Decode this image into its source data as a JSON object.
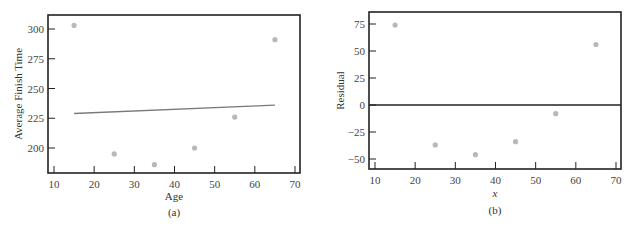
{
  "chart_data": [
    {
      "type": "scatter",
      "panel": "(a)",
      "title": "",
      "xlabel": "Age",
      "ylabel": "Average Finish Time",
      "xlim": [
        8.5,
        71
      ],
      "ylim": [
        180,
        310
      ],
      "xticks": [
        10,
        20,
        30,
        40,
        50,
        60,
        70
      ],
      "yticks": [
        200,
        225,
        250,
        275,
        300
      ],
      "grid": false,
      "series": [
        {
          "name": "observed",
          "x": [
            15,
            25,
            35,
            45,
            55,
            65
          ],
          "y": [
            303,
            195,
            186,
            200,
            226,
            291
          ]
        },
        {
          "name": "regression line",
          "type": "line",
          "x": [
            15,
            65
          ],
          "y": [
            229,
            236
          ]
        }
      ]
    },
    {
      "type": "scatter",
      "panel": "(b)",
      "title": "",
      "xlabel": "x",
      "ylabel": "Residual",
      "xlim": [
        8.5,
        71
      ],
      "ylim": [
        -60,
        85
      ],
      "xticks": [
        10,
        20,
        30,
        40,
        50,
        60,
        70
      ],
      "yticks": [
        -50,
        -25,
        0,
        25,
        50,
        75
      ],
      "grid": false,
      "reference_line": 0,
      "series": [
        {
          "name": "residuals",
          "x": [
            15,
            25,
            35,
            45,
            55,
            65
          ],
          "y": [
            74,
            -37,
            -46,
            -34,
            -8,
            56
          ]
        }
      ]
    }
  ],
  "panels": {
    "a": {
      "caption": "(a)",
      "xlabel": "Age",
      "ylabel": "Average Finish Time"
    },
    "b": {
      "caption": "(b)",
      "xlabel": "x",
      "ylabel": "Residual"
    }
  },
  "colors": {
    "point": "#b8b8b8",
    "line": "#7a7a7a",
    "axis": "#222222"
  }
}
